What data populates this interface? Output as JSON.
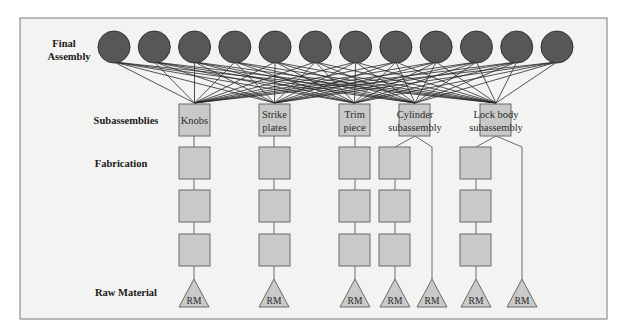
{
  "diagram": {
    "colors": {
      "frame_bg": "#f3f3f2",
      "frame_border": "#7a7a7a",
      "circle_fill": "#575757",
      "circle_stroke": "#333333",
      "box_fill": "#c9c9c9",
      "box_stroke": "#6a6a6a",
      "line": "#2a2a2a"
    },
    "levels": {
      "final_assembly": [
        "Final",
        "Assembly"
      ],
      "subassemblies": "Subassemblies",
      "fabrication": "Fabrication",
      "raw_material": "Raw Material"
    },
    "final_assembly_count": 12,
    "subassemblies": [
      {
        "id": "knobs",
        "lines": [
          "Knobs"
        ]
      },
      {
        "id": "strike-plates",
        "lines": [
          "Strike",
          "plates"
        ]
      },
      {
        "id": "trim-piece",
        "lines": [
          "Trim",
          "piece"
        ]
      },
      {
        "id": "cylinder-subassembly",
        "lines": [
          "Cylinder",
          "subassembly"
        ]
      },
      {
        "id": "lock-body-subassembly",
        "lines": [
          "Lock body",
          "subassembly"
        ]
      }
    ],
    "raw_material_label": "RM",
    "raw_material_count": 7
  }
}
